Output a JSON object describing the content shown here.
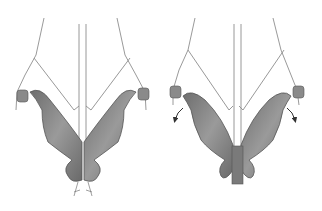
{
  "figure": {
    "panels": [
      {
        "id": "before",
        "description": "lateral processes joined at midline"
      },
      {
        "id": "after",
        "description": "lateral processes separated, rotated outward with arrows"
      }
    ],
    "colors": {
      "background": "#ffffff",
      "process_fill": "#8a8a8a",
      "process_dark": "#5c5c5c",
      "outline": "#555555",
      "line": "#8c8c8c",
      "arrow": "#333333"
    }
  }
}
